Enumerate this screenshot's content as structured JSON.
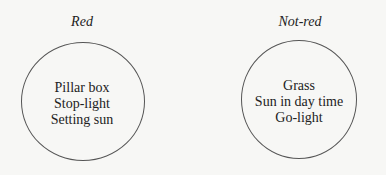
{
  "diagram": {
    "sets": [
      {
        "label": "Red",
        "items": [
          "Pillar box",
          "Stop-light",
          "Setting sun"
        ]
      },
      {
        "label": "Not-red",
        "items": [
          "Grass",
          "Sun in day time",
          "Go-light"
        ]
      }
    ]
  }
}
